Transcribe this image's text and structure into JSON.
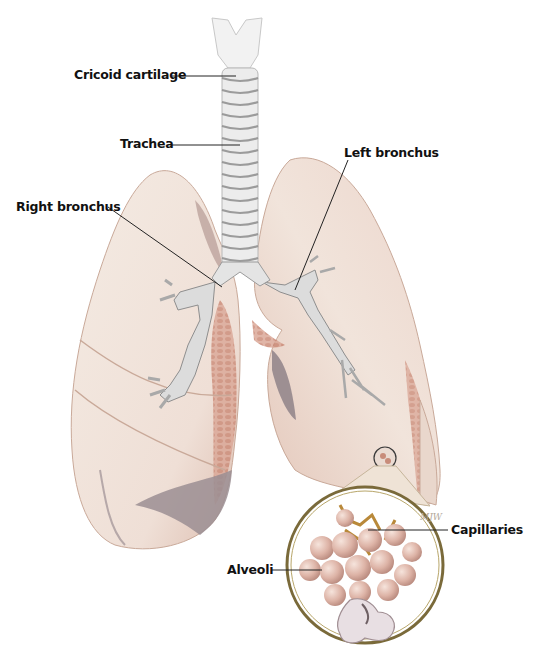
{
  "figure": {
    "colors": {
      "lung_fill": "#f1e4db",
      "lung_shadow": "#d9b8aa",
      "lung_tissue": "#c98f7c",
      "lobe_dark": "#8f8288",
      "trachea": "#e9e9e9",
      "trachea_rings": "#8e8e8e",
      "alveoli": "#ddb3a6",
      "capillaries": "#b9893a",
      "lens_ring": "#7a6a3a",
      "leader_line": "#222222",
      "label_text": "#111111"
    },
    "signature": "MJW"
  },
  "labels": [
    {
      "id": "cricoid",
      "text": "Cricoid cartilage"
    },
    {
      "id": "trachea",
      "text": "Trachea"
    },
    {
      "id": "right_bronchus",
      "text": "Right bronchus"
    },
    {
      "id": "left_bronchus",
      "text": "Left bronchus"
    },
    {
      "id": "capillaries",
      "text": "Capillaries"
    },
    {
      "id": "alveoli",
      "text": "Alveoli"
    }
  ]
}
